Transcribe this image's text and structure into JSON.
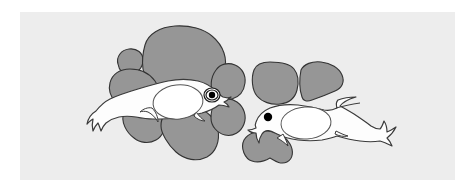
{
  "figure": {
    "title": "Two larval fish with yolk sacs over gray substrate blobs",
    "caption": "",
    "width": 474,
    "height": 191,
    "page_background": "#ffffff",
    "panel": {
      "name": "illustration-panel",
      "x": 20,
      "y": 12,
      "width": 435,
      "height": 168,
      "fill": "#ededed"
    },
    "colors": {
      "background": "#ffffff",
      "panel_fill": "#ededed",
      "blob_fill": "#969696",
      "blob_stroke": "#333333",
      "fish_fill": "#fdfdfd",
      "fish_stroke": "#3a3a3a",
      "yolk_fill": "#ffffff",
      "yolk_stroke": "#555555",
      "eye_pupil": "#000000",
      "eye_ring": "#ffffff",
      "eye_outline": "#1a1a1a"
    },
    "stroke_widths": {
      "blob": 1.1,
      "fish": 1.2,
      "yolk": 1.0,
      "eye": 1.2
    },
    "blobs": [
      {
        "name": "blob-left-small-round",
        "group": "left-cluster",
        "path": "M118,64 C116,57 121,50 129,49 C137,48 143,53 143,60 C143,68 137,74 129,74 C123,74 119,70 118,64 Z"
      },
      {
        "name": "blob-left-large-top",
        "group": "left-cluster",
        "path": "M145,45 C148,34 160,27 175,26 C190,25 204,29 212,36 C218,41 222,47 224,53 C226,59 226,65 224,70 C231,71 234,76 233,82 C232,89 226,93 218,93 C210,93 202,90 196,87 C186,90 172,91 162,88 C152,85 145,78 143,69 C142,62 143,52 145,45 Z"
      },
      {
        "name": "blob-left-mid-left",
        "group": "left-cluster",
        "path": "M110,83 C112,74 120,69 130,69 C141,69 150,74 155,81 C160,88 161,96 158,103 C155,110 148,114 140,114 C131,114 122,110 116,103 C110,96 108,90 110,83 Z"
      },
      {
        "name": "blob-left-right-upper",
        "group": "left-cluster",
        "path": "M216,70 C220,64 228,62 235,65 C242,68 246,75 245,83 C244,91 239,97 232,99 C225,101 218,99 214,94 C210,89 210,78 216,70 Z"
      },
      {
        "name": "blob-left-bottom-left",
        "group": "left-cluster",
        "path": "M124,112 C128,105 137,102 146,104 C155,106 162,112 164,120 C166,128 163,136 156,140 C149,144 140,143 134,138 C127,133 120,122 124,112 Z"
      },
      {
        "name": "blob-left-bottom-center",
        "group": "left-cluster",
        "path": "M164,116 C170,107 183,104 195,107 C207,110 216,119 218,130 C220,141 216,152 207,157 C197,162 185,160 176,152 C168,145 161,133 161,126 C161,122 162,118 164,116 Z"
      },
      {
        "name": "blob-left-bottom-right",
        "group": "left-cluster",
        "path": "M214,105 C220,98 230,97 237,102 C244,107 247,116 244,124 C241,132 233,137 225,135 C217,133 211,126 211,118 C211,113 212,108 214,105 Z"
      },
      {
        "name": "blob-right-left-box",
        "group": "right-cluster",
        "path": "M254,70 C256,65 262,62 270,62 C280,62 290,64 294,69 C298,74 299,82 297,90 C295,98 289,103 280,104 C271,105 262,102 257,96 C252,90 251,78 254,70 Z"
      },
      {
        "name": "blob-right-wing-fin",
        "group": "right-cluster",
        "path": "M301,70 C304,64 312,61 321,62 C331,63 339,68 342,75 C345,82 342,88 335,91 C326,95 318,98 312,100 C307,102 303,101 302,97 C300,91 299,80 301,70 Z"
      },
      {
        "name": "blob-right-bottom",
        "group": "right-cluster",
        "path": "M244,140 C248,133 258,130 268,131 C278,132 286,137 290,144 C294,151 293,159 287,162 C281,165 275,161 270,158 C265,161 258,163 252,161 C245,159 240,148 244,140 Z"
      }
    ],
    "fish": [
      {
        "name": "fish-left",
        "facing": "right",
        "body_path": "M96,111 C100,106 104,102 110,99 C118,95 128,92 138,89 C148,86 158,83 168,81 C178,79 189,79 198,81 C206,83 212,87 216,91 C219,94 221,96 223,97 C226,98 229,98 231,97 C229,99 227,101 224,102 C226,103 228,105 229,107 C226,106 222,105 219,105 C215,108 209,111 202,113 C194,115 185,117 176,118 C168,119 160,119 153,119 C147,119 141,118 136,117 C130,116 124,116 119,117 C114,118 110,120 106,123 C104,125 102,128 101,131 C100,128 99,125 98,123 C96,125 94,128 93,131 C92,127 92,123 93,119 C91,120 89,122 87,124 C88,119 91,114 96,111 Z",
        "yolk": {
          "name": "yolk-sac-left",
          "cx": 178,
          "cy": 102,
          "rx": 25,
          "ry": 17,
          "rotation": -6
        },
        "eye": {
          "name": "eye-left-fish",
          "type": "ringed",
          "cx": 212,
          "cy": 95,
          "outer_rx": 8,
          "outer_ry": 7,
          "ring_rx": 6,
          "ring_ry": 5,
          "pupil_r": 3.2
        },
        "fins": [
          {
            "name": "pectoral-fin-left-fish",
            "path": "M152,108 C156,112 158,117 158,122 C156,118 152,114 148,112 C145,111 142,111 140,112 C143,109 148,107 152,108 Z"
          },
          {
            "name": "ventral-fin-left-fish",
            "path": "M196,112 C199,116 202,119 205,121 C201,121 197,119 194,116 Z"
          }
        ]
      },
      {
        "name": "fish-right",
        "facing": "right",
        "body_path": "M256,122 C258,116 263,111 270,108 C278,105 288,104 298,105 C308,106 317,108 324,110 C329,111 333,110 337,108 C336,105 336,102 338,100 C343,98 350,97 356,97 C349,99 343,102 340,106 C344,108 349,111 354,114 C360,118 366,122 371,126 C374,128 377,129 380,129 C382,127 383,124 384,121 C386,124 387,128 387,132 C390,131 393,129 396,127 C394,131 391,135 387,138 C389,140 391,143 392,146 C388,144 384,142 380,141 C374,142 367,142 360,141 C352,140 344,138 337,136 C332,138 327,139 322,140 C314,141 306,141 298,140 C290,139 283,137 277,134 C271,131 266,128 262,134 C260,137 259,140 259,143 C257,140 256,136 256,133 C253,133 250,132 248,130 C251,130 254,129 256,128 C255,126 255,124 256,122 Z",
        "yolk": {
          "name": "yolk-sac-right-fish",
          "cx": 306,
          "cy": 123,
          "rx": 25,
          "ry": 16,
          "rotation": -4
        },
        "eye": {
          "name": "eye-right-fish",
          "type": "solid-dot",
          "cx": 268,
          "cy": 117,
          "pupil_r": 4.2
        },
        "fins": [
          {
            "name": "pectoral-fin-right-fish",
            "path": "M283,134 C285,138 287,142 288,146 C285,143 281,140 277,138 C280,136 282,135 283,134 Z"
          },
          {
            "name": "ventral-fin-right-fish",
            "path": "M336,131 C340,133 344,135 348,136 C344,137 339,136 335,134 Z"
          },
          {
            "name": "dorsal-ridge-right-fish",
            "path": "M336,108 C344,106 352,104 360,103"
          }
        ]
      }
    ]
  }
}
